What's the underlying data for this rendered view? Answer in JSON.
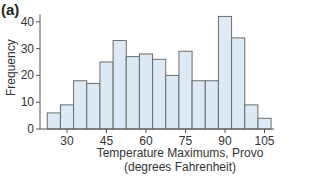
{
  "panel_label": "(a)",
  "chart_data": {
    "type": "bar",
    "title": "",
    "panel": "(a)",
    "xlabel": "Temperature Maximums, Provo (degrees Fahrenheit)",
    "xlabel_line1": "Temperature Maximums, Provo",
    "xlabel_line2": "(degrees Fahrenheit)",
    "ylabel": "Frequency",
    "bin_width": 5,
    "bin_starts": [
      22.5,
      27.5,
      32.5,
      37.5,
      42.5,
      47.5,
      52.5,
      57.5,
      62.5,
      67.5,
      72.5,
      77.5,
      82.5,
      87.5,
      92.5,
      97.5,
      102.5
    ],
    "categories": [
      "22.5-27.5",
      "27.5-32.5",
      "32.5-37.5",
      "37.5-42.5",
      "42.5-47.5",
      "47.5-52.5",
      "52.5-57.5",
      "57.5-62.5",
      "62.5-67.5",
      "67.5-72.5",
      "72.5-77.5",
      "77.5-82.5",
      "82.5-87.5",
      "87.5-92.5",
      "92.5-97.5",
      "97.5-102.5",
      "102.5-107.5"
    ],
    "values": [
      6,
      9,
      18,
      17,
      25,
      33,
      27,
      28,
      26,
      20,
      29,
      18,
      18,
      42,
      34,
      9,
      4
    ],
    "x_ticks": [
      30,
      45,
      60,
      75,
      90,
      105
    ],
    "y_ticks": [
      0,
      10,
      20,
      30,
      40
    ],
    "xlim": [
      22.5,
      107.5
    ],
    "ylim": [
      0,
      42
    ],
    "grid": false,
    "legend": null,
    "colors": {
      "bar_fill": "#ddeaf5",
      "bar_edge": "#6b6b6b",
      "axis": "#555555"
    }
  }
}
